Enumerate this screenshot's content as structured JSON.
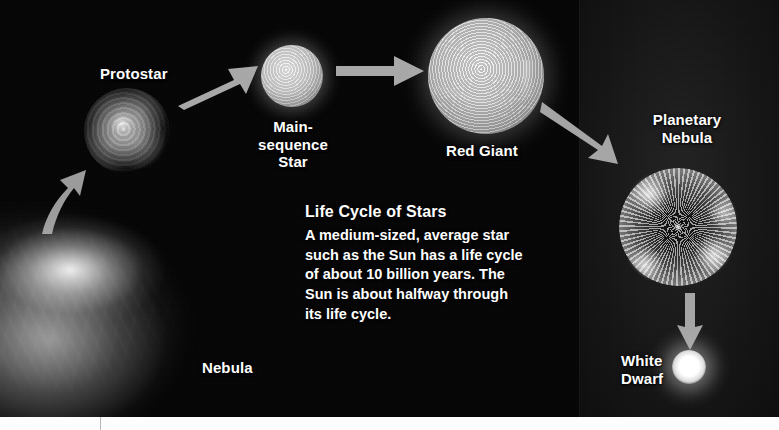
{
  "figure": {
    "title": "Life Cycle of Stars",
    "background_color": "#050505",
    "label_color": "#ffffff",
    "arrow_color": "#b5b5b5"
  },
  "caption": {
    "heading": "Life Cycle of Stars",
    "body": "A medium-sized, average star\nsuch as the Sun has a life cycle\nof about 10 billion years. The\nSun is about halfway through\n its life cycle."
  },
  "stages": [
    {
      "key": "nebula",
      "label": "Nebula",
      "icon": "nebula-cloud-icon"
    },
    {
      "key": "protostar",
      "label": "Protostar",
      "icon": "protostar-icon"
    },
    {
      "key": "mainseq",
      "label": "Main-sequence\nStar",
      "icon": "main-sequence-star-icon"
    },
    {
      "key": "redgiant",
      "label": "Red Giant",
      "icon": "red-giant-icon"
    },
    {
      "key": "plnebula",
      "label": "Planetary\nNebula",
      "icon": "planetary-nebula-icon"
    },
    {
      "key": "whitedwarf",
      "label": "White\nDwarf",
      "icon": "white-dwarf-icon"
    }
  ],
  "arrows": [
    {
      "key": "nebula-to-protostar",
      "from": "Nebula",
      "to": "Protostar",
      "direction": "up-right"
    },
    {
      "key": "protostar-to-mainseq",
      "from": "Protostar",
      "to": "Main-sequence Star",
      "direction": "up-right"
    },
    {
      "key": "mainseq-to-redgiant",
      "from": "Main-sequence Star",
      "to": "Red Giant",
      "direction": "right"
    },
    {
      "key": "redgiant-to-plnebula",
      "from": "Red Giant",
      "to": "Planetary Nebula",
      "direction": "down-right"
    },
    {
      "key": "plnebula-to-whitedwarf",
      "from": "Planetary Nebula",
      "to": "White Dwarf",
      "direction": "down"
    }
  ]
}
